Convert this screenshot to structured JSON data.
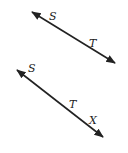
{
  "diagram": {
    "figures": [
      {
        "id": "line-1",
        "type": "line",
        "start": [
          32,
          12
        ],
        "end": [
          115,
          63
        ],
        "points": [
          {
            "label": "S",
            "pos": [
              52,
              24
            ],
            "label_pos": [
              50,
              20
            ]
          },
          {
            "label": "T",
            "pos": [
              95,
              51
            ],
            "label_pos": [
              90,
              47
            ]
          }
        ]
      },
      {
        "id": "line-2",
        "type": "line",
        "start": [
          17,
          70
        ],
        "end": [
          103,
          137
        ],
        "points": [
          {
            "label": "S",
            "pos": [
              0,
              0
            ],
            "label_pos": [
              28,
              71
            ]
          },
          {
            "label": "T",
            "pos": [
              76,
              115
            ],
            "label_pos": [
              70,
              108
            ]
          },
          {
            "label": "X",
            "pos": [
              0,
              0
            ],
            "label_pos": [
              89,
              123
            ]
          }
        ]
      }
    ],
    "colors": {
      "stroke": "#222222",
      "background": "#ffffff"
    }
  }
}
